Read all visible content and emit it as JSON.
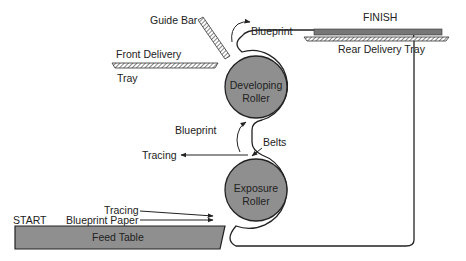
{
  "diagram": {
    "colors": {
      "roller_fill": "#8f8f8f",
      "table_fill": "#8f8f8f",
      "stroke": "#222222",
      "background": "#ffffff"
    },
    "labels": {
      "guide_bar": "Guide Bar",
      "front_delivery": "Front Delivery",
      "tray": "Tray",
      "blueprint_top": "Blueprint",
      "finish": "FINISH",
      "rear_delivery_tray": "Rear Delivery Tray",
      "blueprint_mid": "Blueprint",
      "belts": "Belts",
      "tracing_out": "Tracing",
      "tracing_in": "Tracing",
      "blueprint_paper": "Blueprint Paper",
      "start": "START",
      "feed_table": "Feed Table"
    },
    "rollers": [
      {
        "line1": "Developing",
        "line2": "Roller"
      },
      {
        "line1": "Exposure",
        "line2": "Roller"
      }
    ]
  }
}
